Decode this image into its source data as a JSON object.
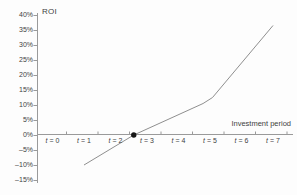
{
  "chart_data": {
    "type": "line",
    "title": "ROI",
    "xlabel": "Investment period",
    "ylabel": "ROI",
    "grid": false,
    "legend": "none",
    "ylim": [
      -15,
      40
    ],
    "y_tick_step": 5,
    "x_labels": [
      "t = 0",
      "t = 1",
      "t = 2",
      "t = 3",
      "t = 4",
      "t = 5",
      "t = 6",
      "t = 7"
    ],
    "y_ticks": [
      {
        "value": 40,
        "label": "40%"
      },
      {
        "value": 35,
        "label": "35%"
      },
      {
        "value": 30,
        "label": "30%"
      },
      {
        "value": 25,
        "label": "25%"
      },
      {
        "value": 20,
        "label": "20%"
      },
      {
        "value": 15,
        "label": "15%"
      },
      {
        "value": 10,
        "label": "10%"
      },
      {
        "value": 5,
        "label": "5%"
      },
      {
        "value": 0,
        "label": "0%"
      },
      {
        "value": -5,
        "label": "–5%"
      },
      {
        "value": -10,
        "label": "–10%"
      },
      {
        "value": -15,
        "label": "–15%"
      }
    ],
    "series": [
      {
        "name": "ROI over investment period (J-curve)",
        "points": [
          {
            "t": 1.0,
            "roi": -10
          },
          {
            "t": 2.58,
            "roi": 0
          },
          {
            "t": 4.78,
            "roi": 10.5
          },
          {
            "t": 5.08,
            "roi": 12.5
          },
          {
            "t": 7.0,
            "roi": 36.5
          }
        ]
      }
    ],
    "markers": [
      {
        "name": "break-even-point",
        "t": 2.58,
        "roi": 0
      }
    ],
    "colors": {
      "axis": "#9a9a9a",
      "line": "#8f8f8f",
      "marker": "#161616",
      "text": "#3f3f3f"
    }
  }
}
